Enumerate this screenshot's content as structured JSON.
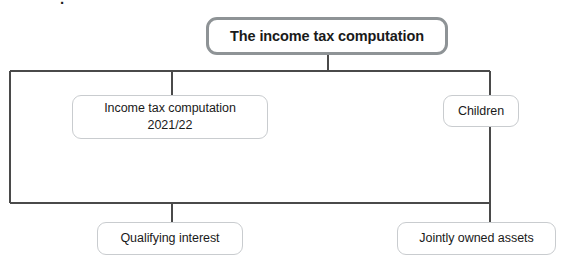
{
  "diagram": {
    "title": "The income tax computation",
    "type": "tree-diagram",
    "background_color": "#ffffff",
    "root": {
      "id": "root",
      "label": "The income tax computation",
      "border_color": "#8e9396",
      "text_color": "#1a1a1a"
    },
    "nodes": [
      {
        "id": "income-tax-computation-2021-22",
        "label": "Income tax computation\n2021/22",
        "border_color": "#c9cccf",
        "text_color": "#1a1a1a",
        "row": 2
      },
      {
        "id": "children",
        "label": "Children",
        "border_color": "#c9cccf",
        "text_color": "#1a1a1a",
        "row": 2
      },
      {
        "id": "qualifying-interest",
        "label": "Qualifying interest",
        "border_color": "#c9cccf",
        "text_color": "#1a1a1a",
        "row": 3
      },
      {
        "id": "jointly-owned-assets",
        "label": "Jointly owned assets",
        "border_color": "#c9cccf",
        "text_color": "#1a1a1a",
        "row": 3
      }
    ],
    "connector_color": "#4a4a4a",
    "top_text_fragment": "."
  }
}
